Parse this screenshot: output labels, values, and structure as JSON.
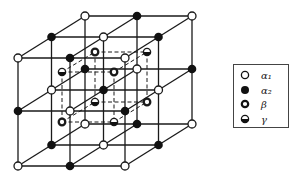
{
  "diagram": {
    "title": "",
    "outer_lattice": {
      "grid_size": 3,
      "nodes": {
        "layer_front": [
          [
            "alpha1",
            "alpha2",
            "alpha1"
          ],
          [
            "alpha2",
            "alpha1",
            "alpha2"
          ],
          [
            "alpha1",
            "alpha2",
            "alpha1"
          ]
        ],
        "layer_middle": [
          [
            "alpha2",
            "alpha1",
            "alpha2"
          ],
          [
            "alpha1",
            "alpha2",
            "alpha1"
          ],
          [
            "alpha2",
            "alpha1",
            "alpha2"
          ]
        ],
        "layer_back": [
          [
            "alpha1",
            "alpha2",
            "alpha1"
          ],
          [
            "alpha2",
            "alpha1",
            "alpha2"
          ],
          [
            "alpha1",
            "alpha2",
            "alpha1"
          ]
        ]
      }
    },
    "inner_cube": {
      "style": "dashed",
      "corners": {
        "front_top_left": "gamma",
        "front_top_right": "beta",
        "front_bottom_left": "beta",
        "front_bottom_right": "gamma",
        "back_top_left": "beta",
        "back_top_right": "gamma",
        "back_bottom_left": "gamma",
        "back_bottom_right": "beta"
      }
    }
  },
  "legend": {
    "items": [
      {
        "key": "alpha1",
        "symbol": "open-circle",
        "label": "α₁"
      },
      {
        "key": "alpha2",
        "symbol": "filled-circle",
        "label": "α₂"
      },
      {
        "key": "beta",
        "symbol": "thick-ring",
        "label": "β"
      },
      {
        "key": "gamma",
        "symbol": "half-filled-circle",
        "label": "γ"
      }
    ]
  },
  "colors": {
    "line": "#1a1a1a",
    "fill": "#000000",
    "background": "#ffffff"
  }
}
